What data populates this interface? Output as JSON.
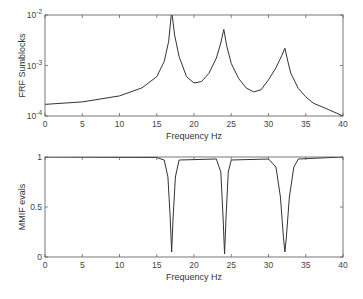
{
  "chart_data": [
    {
      "type": "line",
      "title": "",
      "xlabel": "Frequency Hz",
      "ylabel": "FRF Sumblocks",
      "yscale": "log",
      "xlim": [
        0,
        40
      ],
      "ylim": [
        0.0001,
        0.01
      ],
      "xticks": [
        "0",
        "5",
        "10",
        "15",
        "20",
        "25",
        "30",
        "35",
        "40"
      ],
      "yticks": [
        "10^-4",
        "10^-3",
        "10^-2"
      ],
      "grid": false,
      "series": [
        {
          "name": "FRF sum",
          "x": [
            0,
            5,
            10,
            13,
            15,
            16,
            16.6,
            17,
            17.4,
            18,
            19,
            20,
            21,
            22,
            23,
            23.6,
            24,
            24.4,
            25,
            26,
            27,
            28,
            29,
            30,
            31,
            31.8,
            32.2,
            32.6,
            33,
            34,
            35,
            36,
            38,
            40
          ],
          "y": [
            0.00017,
            0.00019,
            0.00025,
            0.00036,
            0.0006,
            0.0012,
            0.003,
            0.012,
            0.004,
            0.0015,
            0.0006,
            0.00045,
            0.00048,
            0.0007,
            0.0014,
            0.0028,
            0.0052,
            0.0024,
            0.0011,
            0.00055,
            0.00036,
            0.0003,
            0.00033,
            0.00052,
            0.0009,
            0.0016,
            0.0022,
            0.0012,
            0.0007,
            0.00035,
            0.00024,
            0.00018,
            0.000135,
            0.0001
          ]
        }
      ],
      "peaks_hz": [
        17,
        24,
        32.2
      ]
    },
    {
      "type": "line",
      "title": "",
      "xlabel": "Frequency Hz",
      "ylabel": "MMIF evals",
      "xlim": [
        0,
        40
      ],
      "ylim": [
        0,
        1
      ],
      "xticks": [
        "0",
        "5",
        "10",
        "15",
        "20",
        "25",
        "30",
        "35",
        "40"
      ],
      "yticks": [
        "0",
        "0.5",
        "1"
      ],
      "grid": false,
      "series": [
        {
          "name": "MMIF",
          "x": [
            0,
            15,
            16,
            16.5,
            16.8,
            17,
            17.2,
            17.5,
            18,
            23,
            23.6,
            23.9,
            24.1,
            24.3,
            24.6,
            25,
            30,
            31,
            31.6,
            32,
            32.2,
            32.4,
            32.8,
            33.4,
            34,
            40
          ],
          "y": [
            1,
            0.995,
            0.97,
            0.8,
            0.4,
            0.05,
            0.4,
            0.8,
            0.97,
            0.98,
            0.85,
            0.4,
            0.03,
            0.4,
            0.85,
            0.97,
            0.98,
            0.9,
            0.6,
            0.2,
            0.05,
            0.2,
            0.6,
            0.9,
            0.98,
            1
          ]
        }
      ],
      "dips_hz": [
        17,
        24,
        32.2
      ]
    }
  ]
}
